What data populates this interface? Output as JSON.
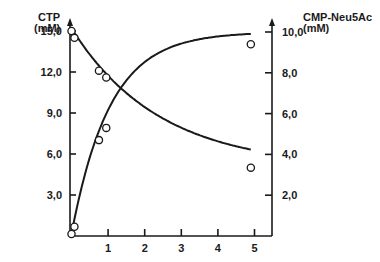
{
  "chart_data": {
    "type": "line",
    "title": "",
    "xlabel": "",
    "ylabel_left": "CTP\n(mM)",
    "ylabel_right": "CMP-Neu5Ac\n(mM)",
    "left_axis": {
      "label_line1": "CTP",
      "label_line2": "(mM)",
      "ticks": [
        "3,0",
        "6,0",
        "9,0",
        "12,0",
        "15,0"
      ],
      "tick_values": [
        3,
        6,
        9,
        12,
        15
      ],
      "ylim": [
        0,
        15
      ]
    },
    "right_axis": {
      "label_line1": "CMP-Neu5Ac",
      "label_line2": "(mM)",
      "ticks": [
        "2,0",
        "4,0",
        "6,0",
        "8,0",
        "10,0"
      ],
      "tick_values": [
        2,
        4,
        6,
        8,
        10
      ],
      "ylim": [
        0,
        10
      ]
    },
    "x_axis": {
      "ticks": [
        "1",
        "2",
        "3",
        "4",
        "5"
      ],
      "tick_values": [
        1,
        2,
        3,
        4,
        5
      ],
      "xlim": [
        0,
        5.5
      ]
    },
    "grid": false,
    "legend": null,
    "series": [
      {
        "name": "CTP",
        "axis": "left",
        "marker": "open-circle",
        "x": [
          0.0,
          0.08,
          0.75,
          0.95,
          4.9
        ],
        "y": [
          15.0,
          14.5,
          12.1,
          11.6,
          5.0
        ]
      },
      {
        "name": "CMP-Neu5Ac",
        "axis": "right",
        "marker": "open-circle",
        "x": [
          0.0,
          0.08,
          0.75,
          0.95,
          4.9
        ],
        "y": [
          0.1,
          0.45,
          4.7,
          5.3,
          9.4
        ]
      }
    ]
  },
  "labels": {
    "left_title_1": "CTP",
    "left_title_2": "(mM)",
    "right_title_1": "CMP-Neu5Ac",
    "right_title_2": "(mM)"
  }
}
